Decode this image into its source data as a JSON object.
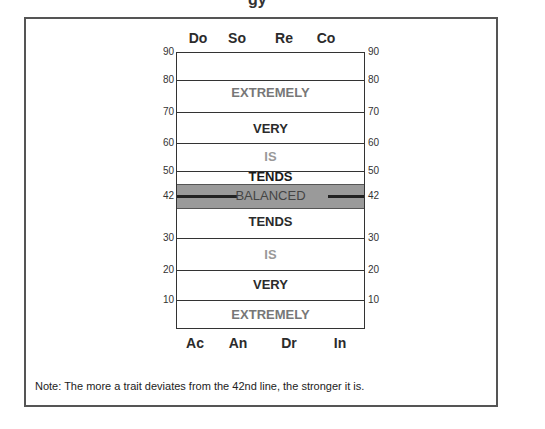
{
  "header": {
    "title_fragment": "gy"
  },
  "top_traits": [
    "Do",
    "So",
    "Re",
    "Co"
  ],
  "bottom_traits": [
    "Ac",
    "An",
    "Dr",
    "In"
  ],
  "scale_ticks": [
    "90",
    "80",
    "70",
    "60",
    "50",
    "42",
    "30",
    "20",
    "10"
  ],
  "zones": [
    {
      "label": "EXTREMELY",
      "color": "#777777"
    },
    {
      "label": "VERY",
      "color": "#2b2b2b"
    },
    {
      "label": "IS",
      "color": "#999999"
    },
    {
      "label": "TENDS",
      "color": "#1a1a1a"
    },
    {
      "label": "BALANCED",
      "color": "#444444"
    },
    {
      "label": "TENDS",
      "color": "#2b2b2b"
    },
    {
      "label": "IS",
      "color": "#999999"
    },
    {
      "label": "VERY",
      "color": "#2b2b2b"
    },
    {
      "label": "EXTREMELY",
      "color": "#777777"
    }
  ],
  "colors": {
    "balanced_band": "#9a9a9a",
    "frame": "#555555"
  },
  "note": "Note: The more a trait deviates from the 42nd line, the stronger it is."
}
